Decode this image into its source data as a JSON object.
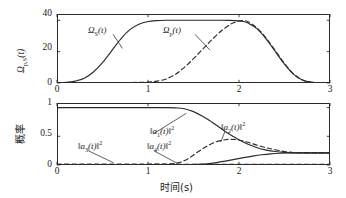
{
  "figure": {
    "width": 346,
    "height": 198,
    "background": "#ffffff",
    "line_color": "#2b2b2b"
  },
  "chart_data": [
    {
      "type": "line",
      "panel": "top",
      "title": "",
      "xlabel": "",
      "ylabel": "Ωp,S(t)",
      "ylabel_parts": {
        "symbol": "Ω",
        "subscript": "p,S",
        "arg": "(t)"
      },
      "xlim": [
        0,
        3
      ],
      "ylim": [
        0,
        44
      ],
      "xticks": [
        0,
        1,
        2,
        3
      ],
      "xticklabels": [
        "0",
        "1",
        "2",
        "3"
      ],
      "yticks": [
        0,
        20,
        40
      ],
      "yticklabels": [
        "0",
        "20",
        "40"
      ],
      "grid": false,
      "legend": "inline-annotations",
      "series": [
        {
          "name": "ΩS(t)",
          "label_parts": {
            "symbol": "Ω",
            "subscript": "S",
            "arg": "(t)"
          },
          "style": "solid",
          "x": [
            0.0,
            0.1,
            0.2,
            0.3,
            0.4,
            0.5,
            0.6,
            0.7,
            0.8,
            0.9,
            1.0,
            1.1,
            1.2,
            1.3,
            1.4,
            1.5,
            1.6,
            1.7,
            1.8,
            1.9,
            2.0,
            2.05,
            2.1,
            2.2,
            2.3,
            2.4,
            2.5,
            2.6,
            2.7,
            2.8,
            2.9,
            3.0
          ],
          "y": [
            0.2,
            0.4,
            1.2,
            3.0,
            7.0,
            13.0,
            20.5,
            28.0,
            34.0,
            37.5,
            39.2,
            39.8,
            40.0,
            40.0,
            40.0,
            40.0,
            40.0,
            40.0,
            40.0,
            39.9,
            39.6,
            39.2,
            38.2,
            34.5,
            28.0,
            20.0,
            12.0,
            5.5,
            1.8,
            0.5,
            0.2,
            0.1
          ]
        },
        {
          "name": "Ωp(t)",
          "label_parts": {
            "symbol": "Ω",
            "subscript": "p",
            "arg": "(t)"
          },
          "style": "dashed",
          "x": [
            0.0,
            0.4,
            0.8,
            1.0,
            1.1,
            1.2,
            1.3,
            1.4,
            1.5,
            1.6,
            1.7,
            1.8,
            1.9,
            1.95,
            2.0,
            2.05,
            2.1,
            2.2,
            2.3,
            2.4,
            2.5,
            2.6,
            2.7,
            2.8,
            2.9,
            3.0
          ],
          "y": [
            0.1,
            0.15,
            0.3,
            0.6,
            1.2,
            2.6,
            5.5,
            10.0,
            15.5,
            21.5,
            27.5,
            33.0,
            37.2,
            38.6,
            39.5,
            39.8,
            39.0,
            35.0,
            28.5,
            20.5,
            12.5,
            5.8,
            1.9,
            0.5,
            0.2,
            0.1
          ]
        }
      ],
      "annotations": [
        {
          "text": "ΩS(t)",
          "x": 0.55,
          "y": 33,
          "leader_to": [
            0.72,
            22
          ]
        },
        {
          "text": "Ωp(t)",
          "x": 1.45,
          "y": 33,
          "leader_to": [
            1.68,
            21
          ]
        }
      ]
    },
    {
      "type": "line",
      "panel": "bottom",
      "title": "",
      "xlabel": "时间(s)",
      "ylabel": "概率",
      "xlim": [
        0,
        3
      ],
      "ylim": [
        0,
        1.08
      ],
      "xticks": [
        0,
        1,
        2,
        3
      ],
      "xticklabels": [
        "0",
        "1",
        "2",
        "3"
      ],
      "yticks": [
        0,
        0.5,
        1
      ],
      "yticklabels": [
        "0",
        "0.5",
        "1"
      ],
      "grid": false,
      "legend": "inline-annotations",
      "series": [
        {
          "name": "‖a1(t)‖²",
          "label_parts": {
            "prefix": "‖",
            "symbol": "a",
            "subscript": "1",
            "arg": "(t)",
            "suffix": "‖",
            "power": "2"
          },
          "style": "solid",
          "x": [
            0.0,
            0.2,
            0.4,
            0.6,
            0.8,
            1.0,
            1.2,
            1.3,
            1.4,
            1.5,
            1.6,
            1.7,
            1.8,
            1.9,
            2.0,
            2.1,
            2.2,
            2.3,
            2.4,
            2.5,
            2.6,
            2.7,
            2.8,
            2.9,
            3.0
          ],
          "y": [
            1.0,
            1.0,
            1.0,
            1.0,
            1.0,
            1.0,
            1.0,
            0.995,
            0.98,
            0.93,
            0.85,
            0.75,
            0.64,
            0.53,
            0.44,
            0.36,
            0.3,
            0.26,
            0.235,
            0.22,
            0.212,
            0.21,
            0.21,
            0.21,
            0.21
          ]
        },
        {
          "name": "‖a2(t)‖²",
          "label_parts": {
            "prefix": "‖",
            "symbol": "a",
            "subscript": "2",
            "arg": "(t)",
            "suffix": "‖",
            "power": "2"
          },
          "style": "dashed",
          "x": [
            0.0,
            0.4,
            0.8,
            1.1,
            1.25,
            1.35,
            1.45,
            1.55,
            1.65,
            1.75,
            1.85,
            1.9,
            1.95,
            2.0,
            2.1,
            2.2,
            2.3,
            2.4,
            2.5,
            2.6,
            2.7,
            2.8,
            2.9,
            3.0
          ],
          "y": [
            0.01,
            0.01,
            0.012,
            0.015,
            0.02,
            0.045,
            0.12,
            0.23,
            0.33,
            0.405,
            0.44,
            0.447,
            0.445,
            0.435,
            0.395,
            0.345,
            0.3,
            0.265,
            0.235,
            0.218,
            0.212,
            0.21,
            0.21,
            0.21
          ]
        },
        {
          "name": "‖a3(t)‖²",
          "label_parts": {
            "prefix": "‖",
            "symbol": "a",
            "subscript": "3",
            "arg": "(t)",
            "suffix": "‖",
            "power": "2"
          },
          "style": "dashed",
          "x": [
            0.0,
            0.3,
            0.6,
            0.9,
            1.2,
            1.5,
            1.8,
            2.1,
            2.4,
            2.7,
            3.0
          ],
          "y": [
            0.012,
            0.012,
            0.012,
            0.012,
            0.012,
            0.012,
            0.012,
            0.012,
            0.012,
            0.012,
            0.012
          ]
        },
        {
          "name": "‖a4(t)‖²",
          "label_parts": {
            "prefix": "‖",
            "symbol": "a",
            "subscript": "4",
            "arg": "(t)",
            "suffix": "‖",
            "power": "2"
          },
          "style": "solid",
          "x": [
            0.0,
            0.4,
            0.8,
            1.1,
            1.3,
            1.45,
            1.55,
            1.65,
            1.75,
            1.85,
            1.95,
            2.05,
            2.15,
            2.25,
            2.35,
            2.45,
            2.55,
            2.65,
            2.75,
            2.85,
            3.0
          ],
          "y": [
            0.006,
            0.006,
            0.006,
            0.006,
            0.006,
            0.008,
            0.012,
            0.022,
            0.042,
            0.068,
            0.098,
            0.128,
            0.155,
            0.178,
            0.195,
            0.205,
            0.21,
            0.211,
            0.211,
            0.211,
            0.211
          ]
        }
      ],
      "annotations": [
        {
          "text": "‖a1(t)‖²",
          "x": 1.02,
          "y": 0.6,
          "leader_to": [
            1.42,
            0.9
          ]
        },
        {
          "text": "‖a2(t)‖²",
          "x": 1.8,
          "y": 0.63,
          "leader_to": [
            1.8,
            0.4
          ]
        },
        {
          "text": "‖a3(t)‖²",
          "x": 0.3,
          "y": 0.3,
          "leader_to": [
            0.62,
            0.04
          ]
        },
        {
          "text": "‖a4(t)‖²",
          "x": 1.02,
          "y": 0.3,
          "leader_to": [
            1.32,
            0.03
          ]
        }
      ]
    }
  ]
}
